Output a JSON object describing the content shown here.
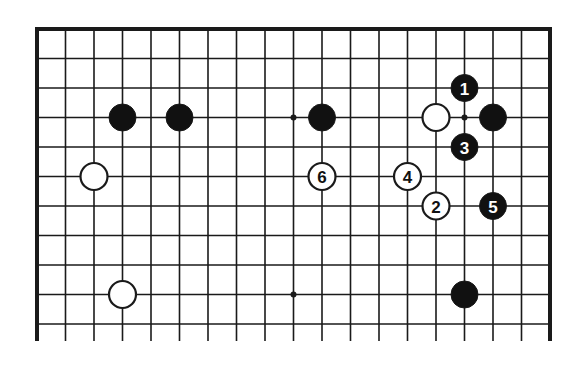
{
  "diagram": {
    "type": "go-board-partial",
    "board_size": 19,
    "visible_rows": 11,
    "edges": {
      "top": "closed",
      "left": "closed",
      "right": "closed",
      "bottom": "open"
    },
    "geometry": {
      "origin_x": 37,
      "origin_y": 29,
      "col_spacing": 28.5,
      "row_spacing": 29.5,
      "stone_radius": 13.5,
      "bottom_line_extension": 17
    },
    "colors": {
      "line": "#1a1a1a",
      "black_stone": "#111111",
      "white_stone": "#ffffff",
      "black_label": "#ffffff",
      "white_label": "#111111",
      "background": "#ffffff"
    },
    "star_points": [
      {
        "col": 3,
        "row": 3
      },
      {
        "col": 9,
        "row": 3
      },
      {
        "col": 15,
        "row": 3
      },
      {
        "col": 3,
        "row": 9
      },
      {
        "col": 9,
        "row": 9
      },
      {
        "col": 15,
        "row": 9
      }
    ],
    "stones": [
      {
        "color": "black",
        "col": 3,
        "row": 3,
        "label": ""
      },
      {
        "color": "black",
        "col": 5,
        "row": 3,
        "label": ""
      },
      {
        "color": "black",
        "col": 10,
        "row": 3,
        "label": ""
      },
      {
        "color": "white",
        "col": 14,
        "row": 3,
        "label": ""
      },
      {
        "color": "black",
        "col": 16,
        "row": 3,
        "label": ""
      },
      {
        "color": "white",
        "col": 2,
        "row": 5,
        "label": ""
      },
      {
        "color": "white",
        "col": 3,
        "row": 9,
        "label": ""
      },
      {
        "color": "black",
        "col": 15,
        "row": 9,
        "label": ""
      },
      {
        "color": "black",
        "col": 15,
        "row": 2,
        "label": "1"
      },
      {
        "color": "white",
        "col": 14,
        "row": 6,
        "label": "2"
      },
      {
        "color": "black",
        "col": 15,
        "row": 4,
        "label": "3"
      },
      {
        "color": "white",
        "col": 13,
        "row": 5,
        "label": "4"
      },
      {
        "color": "black",
        "col": 16,
        "row": 6,
        "label": "5"
      },
      {
        "color": "white",
        "col": 10,
        "row": 5,
        "label": "6"
      }
    ]
  }
}
